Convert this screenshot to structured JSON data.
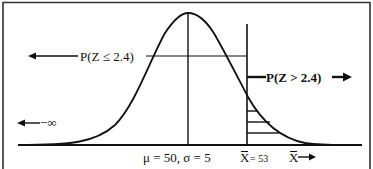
{
  "diagram": {
    "type": "normal-distribution-curve",
    "labels": {
      "left_prob": "P(Z ≤ 2.4)",
      "right_prob": "P(Z > 2.4)",
      "neg_infinity": "−∞",
      "params": "μ = 50, σ = 5",
      "xbar_value_symbol": "X",
      "xbar_value": "= 53",
      "xbar_axis_symbol": "X"
    },
    "parameters": {
      "mean": 50,
      "std_dev": 5,
      "x_bar": 53,
      "z": 2.4
    },
    "colors": {
      "line": "#111111",
      "background": "#ffffff",
      "border": "#333333"
    }
  }
}
